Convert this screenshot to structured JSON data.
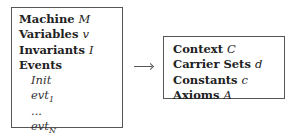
{
  "machine_box": {
    "lines": [
      {
        "keyword": "Machine",
        "var": "M"
      },
      {
        "keyword": "Variables",
        "var": "v"
      },
      {
        "keyword": "Invariants",
        "var": "I"
      }
    ],
    "events_label": "Events",
    "events": [
      {
        "name": "Init",
        "sub": ""
      },
      {
        "name": "evt",
        "sub": "1"
      },
      {
        "name": "...",
        "sub": ""
      },
      {
        "name": "evt",
        "sub": "N"
      }
    ]
  },
  "arrow": {
    "direction": "right",
    "meaning": "sees"
  },
  "context_box": {
    "lines": [
      {
        "keyword": "Context",
        "var": "C"
      },
      {
        "keyword": "Carrier Sets",
        "var": "d"
      },
      {
        "keyword": "Constants",
        "var": "c"
      },
      {
        "keyword": "Axioms",
        "var": "A"
      }
    ]
  }
}
